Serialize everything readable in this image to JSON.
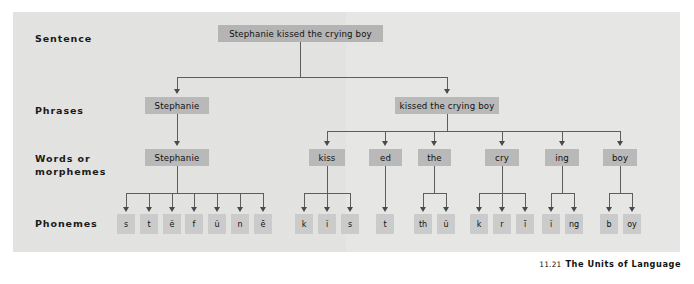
{
  "figure": {
    "number": "11.21",
    "caption": "The Units of Language",
    "panel_color": "#e6e6e4",
    "node_color": "#b9b9b9",
    "phoneme_color": "#cbcbcb",
    "line_color": "#5d5d5d"
  },
  "row_labels": [
    {
      "id": "sentence",
      "text": "Sentence"
    },
    {
      "id": "phrases",
      "text": "Phrases"
    },
    {
      "id": "words",
      "text": "Words or\nmorphemes"
    },
    {
      "id": "phonemes",
      "text": "Phonemes"
    }
  ],
  "sentence": {
    "text": "Stephanie kissed the crying boy"
  },
  "phrases": [
    {
      "text": "Stephanie"
    },
    {
      "text": "kissed the crying boy"
    }
  ],
  "words": [
    {
      "text": "Stephanie"
    },
    {
      "text": "kiss"
    },
    {
      "text": "ed"
    },
    {
      "text": "the"
    },
    {
      "text": "cry"
    },
    {
      "text": "ing"
    },
    {
      "text": "boy"
    }
  ],
  "phonemes": [
    {
      "text": "s"
    },
    {
      "text": "t"
    },
    {
      "text": "ĕ"
    },
    {
      "text": "f"
    },
    {
      "text": "ŭ"
    },
    {
      "text": "n"
    },
    {
      "text": "ē"
    },
    {
      "text": "k"
    },
    {
      "text": "ĭ"
    },
    {
      "text": "s"
    },
    {
      "text": "t"
    },
    {
      "text": "th"
    },
    {
      "text": "ŭ"
    },
    {
      "text": "k"
    },
    {
      "text": "r"
    },
    {
      "text": "ī"
    },
    {
      "text": "ĭ"
    },
    {
      "text": "ng"
    },
    {
      "text": "b"
    },
    {
      "text": "oy"
    }
  ]
}
